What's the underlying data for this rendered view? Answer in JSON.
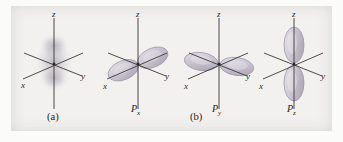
{
  "figure": {
    "background_color": "#f2f1ef",
    "page_color": "#fbfbfa",
    "axis_color": "#3a3936",
    "lobe_fill": "#cfc9d4",
    "lobe_edge": "#8f8a99",
    "cloud_color": "#b9b4bf"
  },
  "captions": {
    "a": "(a)",
    "b": "(b)"
  },
  "panels": [
    {
      "id": "a",
      "kind": "s-orbital-cloud",
      "orbital_label": "",
      "orbital_label_sub": "",
      "axis_labels": {
        "x": "x",
        "y": "y",
        "z": "z"
      },
      "lobe_axis": "z",
      "description": "diffuse spherical electron cloud centered at origin, elongated along z"
    },
    {
      "id": "px",
      "kind": "p-orbital",
      "orbital_label": "P",
      "orbital_label_sub": "x",
      "axis_labels": {
        "x": "x",
        "y": "y",
        "z": "z"
      },
      "lobe_axis": "x",
      "description": "two lobes directed along the x axis (lower-left / upper-right)"
    },
    {
      "id": "py",
      "kind": "p-orbital",
      "orbital_label": "P",
      "orbital_label_sub": "y",
      "axis_labels": {
        "x": "x",
        "y": "y",
        "z": "z"
      },
      "lobe_axis": "y",
      "description": "two lobes directed along the y axis (horizontal, left / right)"
    },
    {
      "id": "pz",
      "kind": "p-orbital",
      "orbital_label": "P",
      "orbital_label_sub": "z",
      "axis_labels": {
        "x": "x",
        "y": "y",
        "z": "z"
      },
      "lobe_axis": "z",
      "description": "two lobes directed along the vertical z axis (up / down)"
    }
  ]
}
